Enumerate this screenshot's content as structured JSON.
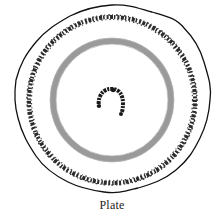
{
  "figure": {
    "caption": "Plate",
    "colors": {
      "background": "#ffffff",
      "outline": "#111111",
      "band": "#9a9a9a",
      "garland": "#1a1a1a"
    }
  }
}
